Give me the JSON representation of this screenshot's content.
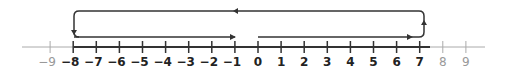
{
  "diagram": {
    "type": "number-line",
    "range": {
      "min": -9,
      "max": 9
    },
    "highlighted_range": {
      "min": -8,
      "max": 7
    },
    "tick_labels": [
      "−9",
      "−8",
      "−7",
      "−6",
      "−5",
      "−4",
      "−3",
      "−2",
      "−1",
      "0",
      "1",
      "2",
      "3",
      "4",
      "5",
      "6",
      "7",
      "8",
      "9"
    ],
    "colors": {
      "axis_highlight": "#333333",
      "axis_faded": "#aaaaaa",
      "label_highlight": "#222222",
      "label_faded": "#999999",
      "path": "#333333"
    },
    "paths": [
      {
        "name": "segment-left",
        "from": -8,
        "to": -1,
        "direction": "right"
      },
      {
        "name": "segment-right",
        "from": 0,
        "to": 7,
        "direction": "right"
      },
      {
        "name": "loop-return",
        "from": 7,
        "to": -8,
        "direction": "left",
        "via": "upper-track"
      }
    ]
  }
}
